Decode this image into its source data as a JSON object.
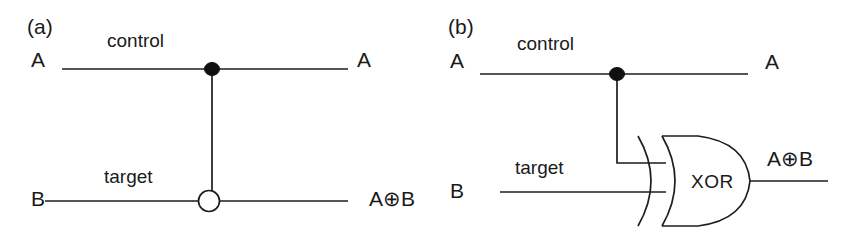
{
  "figure": {
    "background_color": "#ffffff",
    "ink_color": "#1d1d1d",
    "width": 852,
    "height": 234
  },
  "panels": [
    {
      "tag": "(a)",
      "description": "CNOT gate quantum circuit symbol",
      "inputs": [
        {
          "label": "A",
          "wire_name": "control"
        },
        {
          "label": "B",
          "wire_name": "target"
        }
      ],
      "outputs": [
        {
          "label": "A"
        },
        {
          "label": "A",
          "operator": "⊕",
          "operand": "B"
        }
      ],
      "symbols": [
        {
          "name": "control-dot",
          "shape": "filled-circle"
        },
        {
          "name": "target-circle",
          "shape": "open-circle-with-cross"
        },
        {
          "name": "vertical-connector",
          "shape": "line"
        }
      ]
    },
    {
      "tag": "(b)",
      "description": "Classical equivalent drawn with an XOR gate",
      "inputs": [
        {
          "label": "A",
          "wire_name": "control"
        },
        {
          "label": "B",
          "wire_name": "target"
        }
      ],
      "outputs": [
        {
          "label": "A"
        },
        {
          "label": "A",
          "operator": "⊕",
          "operand": "B"
        }
      ],
      "gate": {
        "name": "xor-gate",
        "text": "XOR"
      },
      "symbols": [
        {
          "name": "control-dot",
          "shape": "filled-circle"
        },
        {
          "name": "branch-connector",
          "shape": "elbow-line"
        }
      ]
    }
  ]
}
